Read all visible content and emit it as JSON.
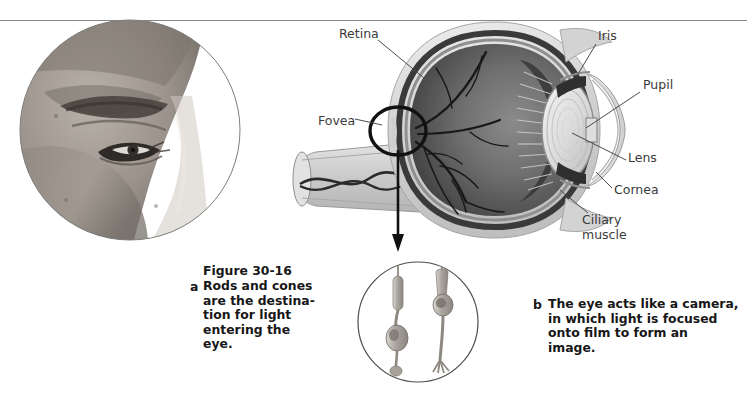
{
  "figure": {
    "number": "Figure 30-16",
    "top_rule_color": "#8a8a8a",
    "background": "#ffffff"
  },
  "photo_panel": {
    "name": "profile-face-photograph",
    "description": "Circular grayscale photograph of a human face in profile showing the eye, eyebrow and nose",
    "circle": {
      "cx": 130,
      "cy": 130,
      "r": 110
    },
    "border_color": "#7d7d7d"
  },
  "eye_diagram": {
    "name": "eye-cross-section",
    "description": "Cutaway cross-section of the human eyeball",
    "sclera_color": "#d9d9d9",
    "choroid_color": "#4a4a4a",
    "vitreous_color": "#6e6e6e",
    "lens_color": "#e6e6e6",
    "labels": [
      {
        "id": "retina",
        "text": "Retina",
        "x": 339,
        "y": 33,
        "anchor": "start"
      },
      {
        "id": "fovea",
        "text": "Fovea",
        "x": 318,
        "y": 120,
        "anchor": "start"
      },
      {
        "id": "iris",
        "text": "Iris",
        "x": 598,
        "y": 35,
        "anchor": "start"
      },
      {
        "id": "pupil",
        "text": "Pupil",
        "x": 643,
        "y": 84,
        "anchor": "start"
      },
      {
        "id": "lens",
        "text": "Lens",
        "x": 628,
        "y": 157,
        "anchor": "start"
      },
      {
        "id": "cornea",
        "text": "Cornea",
        "x": 614,
        "y": 189,
        "anchor": "start"
      },
      {
        "id": "ciliary",
        "text": "Ciliary\nmuscle",
        "x": 582,
        "y": 219,
        "anchor": "start"
      }
    ]
  },
  "rods_cones_inset": {
    "name": "rods-and-cones-inset",
    "description": "Magnified circular inset showing a rod cell and a cone cell photoreceptor",
    "circle": {
      "cx": 418,
      "cy": 322,
      "r": 60
    },
    "border_color": "#4d4d4d",
    "cells": [
      {
        "id": "rod",
        "label": "rod photoreceptor cell"
      },
      {
        "id": "cone",
        "label": "cone photoreceptor cell"
      }
    ]
  },
  "captions": {
    "a": {
      "marker": "a",
      "title": "Figure 30-16",
      "text": "Rods and cones\nare the destina-\ntion for light\nentering the\neye."
    },
    "b": {
      "marker": "b",
      "text": "The eye acts like a camera,\nin which light is focused\nonto film to form an\nimage."
    }
  }
}
